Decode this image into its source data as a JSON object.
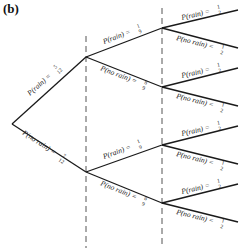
{
  "panel_label": "(b)",
  "tree": {
    "level1": [
      {
        "label": "P(rain) = ",
        "num": "5",
        "den": "12"
      },
      {
        "label": "P(no rain) = ",
        "num": "7",
        "den": "12"
      }
    ],
    "level2": [
      {
        "label": "P(rain) = ",
        "num": "1",
        "den": "9"
      },
      {
        "label": "P(no rain) = ",
        "num": "8",
        "den": "9"
      },
      {
        "label": "P(rain) = ",
        "num": "1",
        "den": "9"
      },
      {
        "label": "P(no rain) = ",
        "num": "8",
        "den": "9"
      }
    ],
    "level3": [
      {
        "label": "P(rain) = ",
        "num": "1",
        "den": "2"
      },
      {
        "label": "P(no rain) = ",
        "num": "1",
        "den": "2"
      },
      {
        "label": "P(rain) = ",
        "num": "1",
        "den": "2"
      },
      {
        "label": "P(no rain) = ",
        "num": "1",
        "den": "2"
      },
      {
        "label": "P(rain) = ",
        "num": "1",
        "den": "2"
      },
      {
        "label": "P(no rain) = ",
        "num": "1",
        "den": "2"
      },
      {
        "label": "P(rain) = ",
        "num": "1",
        "den": "2"
      },
      {
        "label": "P(no rain) = ",
        "num": "1",
        "den": "2"
      }
    ]
  }
}
